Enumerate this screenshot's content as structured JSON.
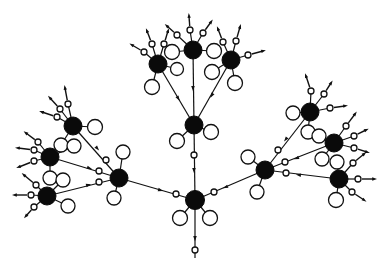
{
  "diagram": {
    "title": "",
    "colors": {
      "background": "#ffffff",
      "hub": "#0a0a0a",
      "stroke": "#111111",
      "leaf_fill": "#ffffff"
    },
    "hubs": [
      {
        "id": "root",
        "x": 195,
        "y": 200,
        "r": 9.5
      },
      {
        "id": "mid",
        "x": 194,
        "y": 125,
        "r": 9
      },
      {
        "id": "top",
        "x": 193,
        "y": 50,
        "r": 9
      },
      {
        "id": "top_left",
        "x": 158,
        "y": 64,
        "r": 9
      },
      {
        "id": "top_right",
        "x": 231,
        "y": 60,
        "r": 9
      },
      {
        "id": "left",
        "x": 119,
        "y": 178,
        "r": 9
      },
      {
        "id": "left_a",
        "x": 73,
        "y": 126,
        "r": 9
      },
      {
        "id": "left_b",
        "x": 50,
        "y": 157,
        "r": 9
      },
      {
        "id": "left_c",
        "x": 47,
        "y": 196,
        "r": 9
      },
      {
        "id": "right",
        "x": 265,
        "y": 170,
        "r": 9
      },
      {
        "id": "right_a",
        "x": 310,
        "y": 112,
        "r": 9
      },
      {
        "id": "right_b",
        "x": 334,
        "y": 143,
        "r": 9
      },
      {
        "id": "right_c",
        "x": 339,
        "y": 179,
        "r": 9
      }
    ],
    "edges": [
      {
        "from": "mid",
        "to": "root",
        "port": [
          194,
          155
        ],
        "arrow": [
          194,
          170
        ]
      },
      {
        "from": "top",
        "to": "mid",
        "port": null,
        "arrow": [
          193,
          88
        ]
      },
      {
        "from": "top_left",
        "to": "mid",
        "port": null,
        "arrow": [
          178,
          98
        ]
      },
      {
        "from": "top_right",
        "to": "mid",
        "port": null,
        "arrow": [
          212,
          95
        ]
      },
      {
        "from": "left",
        "to": "root",
        "port": [
          176,
          194
        ],
        "arrow": [
          160,
          190
        ]
      },
      {
        "from": "right",
        "to": "root",
        "port": [
          214,
          192
        ],
        "arrow": [
          226,
          187
        ]
      },
      {
        "from": "left_a",
        "to": "left",
        "port": [
          106,
          160
        ],
        "arrow": [
          97,
          148
        ]
      },
      {
        "from": "left_b",
        "to": "left",
        "port": [
          99,
          171
        ],
        "arrow": [
          89,
          168
        ]
      },
      {
        "from": "left_c",
        "to": "left",
        "port": [
          99,
          182
        ],
        "arrow": [
          88,
          185
        ]
      },
      {
        "from": "right_a",
        "to": "right",
        "port": [
          278,
          150
        ],
        "arrow": [
          286,
          139
        ]
      },
      {
        "from": "right_b",
        "to": "right",
        "port": [
          285,
          162
        ],
        "arrow": [
          297,
          158
        ]
      },
      {
        "from": "right_c",
        "to": "right",
        "port": [
          286,
          173
        ],
        "arrow": [
          299,
          175
        ]
      },
      {
        "from": "root",
        "to": "out",
        "to_xy": [
          195,
          258
        ],
        "port": [
          195,
          250
        ],
        "arrow": [
          195,
          238
        ]
      }
    ],
    "leaves": [
      {
        "hub": "root",
        "x": 180,
        "y": 218,
        "r": 7.5
      },
      {
        "hub": "root",
        "x": 210,
        "y": 218,
        "r": 7.5
      },
      {
        "hub": "mid",
        "x": 177,
        "y": 141,
        "r": 7.5
      },
      {
        "hub": "mid",
        "x": 211,
        "y": 132,
        "r": 7.5
      },
      {
        "hub": "top",
        "x": 172,
        "y": 52,
        "r": 7.5
      },
      {
        "hub": "top",
        "x": 214,
        "y": 51,
        "r": 7.5
      },
      {
        "hub": "top_left",
        "x": 177,
        "y": 69,
        "r": 6.5
      },
      {
        "hub": "top_left",
        "x": 152,
        "y": 87,
        "r": 7.5
      },
      {
        "hub": "top_right",
        "x": 212,
        "y": 72,
        "r": 7.5
      },
      {
        "hub": "top_right",
        "x": 235,
        "y": 83,
        "r": 7.5
      },
      {
        "hub": "left",
        "x": 123,
        "y": 152,
        "r": 7
      },
      {
        "hub": "left",
        "x": 114,
        "y": 198,
        "r": 7
      },
      {
        "hub": "left_a",
        "x": 95,
        "y": 127,
        "r": 7.5
      },
      {
        "hub": "left_a",
        "x": 61,
        "y": 145,
        "r": 7
      },
      {
        "hub": "left_b",
        "x": 74,
        "y": 146,
        "r": 7
      },
      {
        "hub": "left_b",
        "x": 50,
        "y": 178,
        "r": 7
      },
      {
        "hub": "left_c",
        "x": 63,
        "y": 180,
        "r": 7
      },
      {
        "hub": "left_c",
        "x": 68,
        "y": 206,
        "r": 7
      },
      {
        "hub": "right",
        "x": 248,
        "y": 157,
        "r": 7
      },
      {
        "hub": "right",
        "x": 257,
        "y": 192,
        "r": 7
      },
      {
        "hub": "right_a",
        "x": 293,
        "y": 113,
        "r": 7
      },
      {
        "hub": "right_a",
        "x": 308,
        "y": 132,
        "r": 7
      },
      {
        "hub": "right_b",
        "x": 319,
        "y": 136,
        "r": 7
      },
      {
        "hub": "right_b",
        "x": 322,
        "y": 159,
        "r": 7
      },
      {
        "hub": "right_c",
        "x": 337,
        "y": 162,
        "r": 7
      },
      {
        "hub": "right_c",
        "x": 336,
        "y": 200,
        "r": 7.5
      }
    ],
    "outward_ports": [
      {
        "hub": "top",
        "px": 177,
        "py": 35,
        "ax": 167,
        "ay": 26
      },
      {
        "hub": "top",
        "px": 190,
        "py": 30,
        "ax": 189,
        "ay": 16
      },
      {
        "hub": "top",
        "px": 203,
        "py": 33,
        "ax": 211,
        "ay": 22
      },
      {
        "hub": "top_left",
        "px": 144,
        "py": 52,
        "ax": 132,
        "ay": 45
      },
      {
        "hub": "top_left",
        "px": 152,
        "py": 44,
        "ax": 147,
        "ay": 31
      },
      {
        "hub": "top_left",
        "px": 164,
        "py": 44,
        "ax": 168,
        "ay": 31
      },
      {
        "hub": "top_right",
        "px": 223,
        "py": 42,
        "ax": 218,
        "ay": 29
      },
      {
        "hub": "top_right",
        "px": 236,
        "py": 41,
        "ax": 240,
        "ay": 27
      },
      {
        "hub": "top_right",
        "px": 248,
        "py": 55,
        "ax": 263,
        "ay": 51
      },
      {
        "hub": "left_a",
        "px": 57,
        "py": 117,
        "ax": 42,
        "ay": 112
      },
      {
        "hub": "left_a",
        "px": 60,
        "py": 109,
        "ax": 50,
        "ay": 98
      },
      {
        "hub": "left_a",
        "px": 68,
        "py": 104,
        "ax": 65,
        "ay": 88
      },
      {
        "hub": "left_b",
        "px": 38,
        "py": 142,
        "ax": 26,
        "ay": 133
      },
      {
        "hub": "left_b",
        "px": 34,
        "py": 150,
        "ax": 18,
        "ay": 148
      },
      {
        "hub": "left_b",
        "px": 34,
        "py": 161,
        "ax": 19,
        "ay": 167
      },
      {
        "hub": "left_c",
        "px": 36,
        "py": 185,
        "ax": 24,
        "ay": 175
      },
      {
        "hub": "left_c",
        "px": 31,
        "py": 195,
        "ax": 15,
        "ay": 195
      },
      {
        "hub": "left_c",
        "px": 34,
        "py": 207,
        "ax": 26,
        "ay": 216
      },
      {
        "hub": "right_a",
        "px": 311,
        "py": 91,
        "ax": 306,
        "ay": 76
      },
      {
        "hub": "right_a",
        "px": 324,
        "py": 94,
        "ax": 331,
        "ay": 83
      },
      {
        "hub": "right_a",
        "px": 330,
        "py": 108,
        "ax": 345,
        "ay": 106
      },
      {
        "hub": "right_b",
        "px": 346,
        "py": 126,
        "ax": 355,
        "ay": 114
      },
      {
        "hub": "right_b",
        "px": 354,
        "py": 136,
        "ax": 366,
        "ay": 130
      },
      {
        "hub": "right_b",
        "px": 354,
        "py": 148,
        "ax": 367,
        "ay": 152
      },
      {
        "hub": "right_c",
        "px": 353,
        "py": 163,
        "ax": 364,
        "ay": 154
      },
      {
        "hub": "right_c",
        "px": 358,
        "py": 179,
        "ax": 374,
        "ay": 179
      },
      {
        "hub": "right_c",
        "px": 352,
        "py": 192,
        "ax": 364,
        "ay": 200
      }
    ]
  }
}
